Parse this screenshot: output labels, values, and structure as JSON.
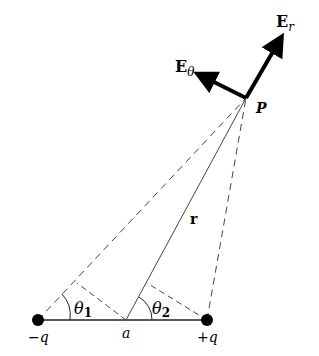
{
  "diagram": {
    "labels": {
      "E_r_main": "E",
      "E_r_sub": "r",
      "E_theta_main": "E",
      "E_theta_sub": "θ",
      "point_P": "P",
      "r": "r",
      "theta1_main": "θ",
      "theta1_sub": "1",
      "theta2_main": "θ",
      "theta2_sub": "2",
      "a": "a",
      "neg_charge": "−q",
      "pos_charge": "+q"
    },
    "points": {
      "P": [
        246,
        98
      ],
      "neg_q": [
        38,
        320
      ],
      "pos_q": [
        207,
        320
      ],
      "a": [
        126,
        320
      ]
    },
    "colors": {
      "ink": "#000000",
      "line": "#444444",
      "background": "#ffffff"
    }
  }
}
